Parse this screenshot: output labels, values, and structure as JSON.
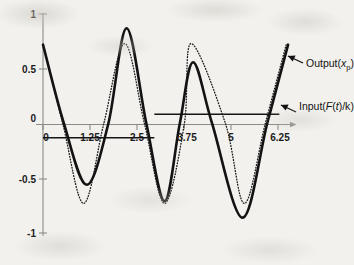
{
  "figure": {
    "background_color": "#f2f1ee",
    "ink_color": "#131313",
    "axis_color": "#8a8a88"
  },
  "annotations": {
    "output": {
      "prefix": "Output(",
      "variable": "x",
      "subscript": "p",
      "suffix": ")",
      "full_text": "Output(xp)"
    },
    "input": {
      "prefix": "Input(",
      "func": "F",
      "open": "(",
      "arg": "t",
      "close": ")/k",
      "suffix": ")",
      "full_text": "Input(F(t)/k)"
    }
  },
  "chart_data": {
    "type": "line",
    "title": "",
    "xlabel": "",
    "ylabel": "",
    "xlim": [
      0,
      6.5
    ],
    "ylim": [
      -1,
      1
    ],
    "xticks": [
      0,
      1.25,
      2.5,
      3.75,
      5,
      6.25
    ],
    "xticklabels": [
      "0",
      "1.25",
      "2.5",
      "3.75",
      "5",
      "6.25"
    ],
    "yticks": [
      1,
      0.5,
      0,
      -0.5,
      -1
    ],
    "yticklabels": [
      "1",
      "0.5",
      "0",
      "-0.5",
      "-1"
    ],
    "grid": false,
    "legend_position": "annotated-arrows",
    "series": [
      {
        "name": "Output(xp)",
        "style": "solid",
        "linewidth": 2.6,
        "color": "#131313",
        "description": "Beating response: superposition of forced and free vibration at close frequencies",
        "amplitude_envelope_note": "peaks 0.72, 0.87, 0.56, 0.72; troughs -0.56, -0.71, -0.86",
        "key_points": [
          {
            "x": 0.0,
            "y": 0.72
          },
          {
            "x": 0.55,
            "y": 0.0
          },
          {
            "x": 1.15,
            "y": -0.56
          },
          {
            "x": 1.72,
            "y": 0.0
          },
          {
            "x": 2.2,
            "y": 0.87
          },
          {
            "x": 2.72,
            "y": 0.0
          },
          {
            "x": 3.2,
            "y": -0.71
          },
          {
            "x": 3.6,
            "y": 0.0
          },
          {
            "x": 3.95,
            "y": 0.56
          },
          {
            "x": 4.45,
            "y": 0.0
          },
          {
            "x": 5.25,
            "y": -0.86
          },
          {
            "x": 5.9,
            "y": 0.0
          },
          {
            "x": 6.45,
            "y": 0.72
          }
        ]
      },
      {
        "name": "Input(F(t)/k)",
        "style": "dotted",
        "linewidth": 1.35,
        "color": "#1d1d1d",
        "description": "Harmonic forcing normalized by stiffness; constant amplitude sinusoid",
        "amplitude": 0.73,
        "period": 2.1,
        "key_points": [
          {
            "x": 0.0,
            "y": 0.72
          },
          {
            "x": 0.52,
            "y": 0.0
          },
          {
            "x": 1.07,
            "y": -0.73
          },
          {
            "x": 1.6,
            "y": 0.0
          },
          {
            "x": 2.15,
            "y": 0.73
          },
          {
            "x": 2.67,
            "y": 0.0
          },
          {
            "x": 3.2,
            "y": -0.73
          },
          {
            "x": 3.72,
            "y": 0.0
          },
          {
            "x": 3.9,
            "y": 0.73
          },
          {
            "x": 4.8,
            "y": 0.0
          },
          {
            "x": 5.3,
            "y": -0.73
          },
          {
            "x": 5.85,
            "y": 0.0
          },
          {
            "x": 6.4,
            "y": 0.72
          }
        ]
      }
    ],
    "reference_lines": [
      {
        "name": "lower-rule",
        "y": -0.13,
        "x_start": 0.0,
        "x_end": 2.93
      },
      {
        "name": "upper-rule",
        "y": 0.085,
        "x_start": 2.93,
        "x_end": 6.22
      }
    ]
  }
}
